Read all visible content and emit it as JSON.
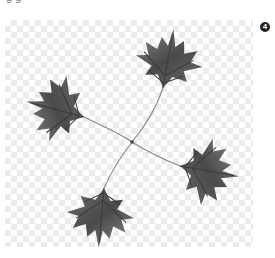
{
  "caption": {
    "text": "g g"
  },
  "image": {
    "alt": "four maple leaves arranged in a pinwheel with stems crossing at center",
    "background": "transparency-checkerboard",
    "leaf_color": "#5a5a5a",
    "stem_color": "#888888",
    "leaves": [
      {
        "position": "top",
        "cx": 156,
        "cy": 62
      },
      {
        "position": "left",
        "cx": 55,
        "cy": 108
      },
      {
        "position": "right",
        "cx": 210,
        "cy": 172
      },
      {
        "position": "bottom",
        "cx": 105,
        "cy": 210
      }
    ]
  },
  "badge": {
    "label": "4",
    "color": "#222222"
  }
}
